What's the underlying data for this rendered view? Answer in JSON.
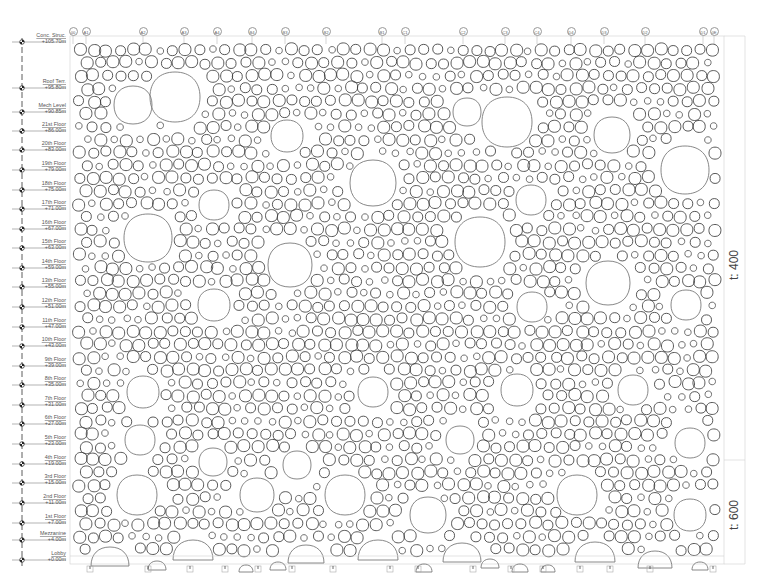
{
  "levels": [
    {
      "name": "Conc. Struc.",
      "elevation": "+105.70m",
      "y": 42
    },
    {
      "name": "Roof Terr.",
      "elevation": "+95.80m",
      "y": 88
    },
    {
      "name": "Mech Level",
      "elevation": "+90.85m",
      "y": 112
    },
    {
      "name": "21st Floor",
      "elevation": "+86.00m",
      "y": 131
    },
    {
      "name": "20th Floor",
      "elevation": "+83.00m",
      "y": 150
    },
    {
      "name": "19th Floor",
      "elevation": "+79.00m",
      "y": 170
    },
    {
      "name": "18th Floor",
      "elevation": "+75.00m",
      "y": 190
    },
    {
      "name": "17th Floor",
      "elevation": "+71.00m",
      "y": 209
    },
    {
      "name": "16th Floor",
      "elevation": "+67.00m",
      "y": 229
    },
    {
      "name": "15th Floor",
      "elevation": "+63.00m",
      "y": 248
    },
    {
      "name": "14th Floor",
      "elevation": "+59.00m",
      "y": 268
    },
    {
      "name": "13th Floor",
      "elevation": "+55.00m",
      "y": 287
    },
    {
      "name": "12th Floor",
      "elevation": "+51.00m",
      "y": 307
    },
    {
      "name": "11th Floor",
      "elevation": "+47.00m",
      "y": 327
    },
    {
      "name": "10th Floor",
      "elevation": "+43.00m",
      "y": 346
    },
    {
      "name": "9th Floor",
      "elevation": "+39.00m",
      "y": 366
    },
    {
      "name": "8th Floor",
      "elevation": "+35.00m",
      "y": 385
    },
    {
      "name": "7th Floor",
      "elevation": "+31.00m",
      "y": 405
    },
    {
      "name": "6th Floor",
      "elevation": "+27.00m",
      "y": 424
    },
    {
      "name": "5th Floor",
      "elevation": "+23.00m",
      "y": 444
    },
    {
      "name": "4th Floor",
      "elevation": "+19.00m",
      "y": 464
    },
    {
      "name": "3rd Floor",
      "elevation": "+15.00m",
      "y": 483
    },
    {
      "name": "2nd Floor",
      "elevation": "+11.00m",
      "y": 503
    },
    {
      "name": "1st Floor",
      "elevation": "+7.00m",
      "y": 523
    },
    {
      "name": "Mezzanine",
      "elevation": "+4.00m",
      "y": 540
    },
    {
      "name": "Lobby",
      "elevation": "+0.00m",
      "y": 560
    }
  ],
  "grid_lines": [
    {
      "label": "00",
      "x": 73
    },
    {
      "label": "A1",
      "x": 86
    },
    {
      "label": "A2",
      "x": 143
    },
    {
      "label": "A3",
      "x": 184
    },
    {
      "label": "A4",
      "x": 217
    },
    {
      "label": "B4",
      "x": 252
    },
    {
      "label": "B3",
      "x": 285
    },
    {
      "label": "B2",
      "x": 326
    },
    {
      "label": "B1",
      "x": 382
    },
    {
      "label": "C1",
      "x": 405
    },
    {
      "label": "C2",
      "x": 463
    },
    {
      "label": "C3",
      "x": 505
    },
    {
      "label": "C4",
      "x": 537
    },
    {
      "label": "D4",
      "x": 571
    },
    {
      "label": "D3",
      "x": 604
    },
    {
      "label": "D2",
      "x": 645
    },
    {
      "label": "D1",
      "x": 703
    },
    {
      "label": "0E",
      "x": 714
    }
  ],
  "annotations": [
    {
      "text": "t: 400",
      "x": 737,
      "y": 265
    },
    {
      "text": "t: 600",
      "x": 737,
      "y": 515
    }
  ],
  "large_openings": [
    [
      133,
      105,
      38
    ],
    [
      175,
      97,
      50
    ],
    [
      287,
      136,
      32
    ],
    [
      467,
      112,
      28
    ],
    [
      507,
      122,
      50
    ],
    [
      612,
      135,
      36
    ],
    [
      373,
      183,
      46
    ],
    [
      214,
      205,
      30
    ],
    [
      531,
      200,
      30
    ],
    [
      685,
      170,
      48
    ],
    [
      148,
      238,
      48
    ],
    [
      480,
      242,
      50
    ],
    [
      290,
      265,
      44
    ],
    [
      608,
      283,
      44
    ],
    [
      214,
      305,
      32
    ],
    [
      532,
      307,
      30
    ],
    [
      686,
      305,
      30
    ],
    [
      143,
      392,
      32
    ],
    [
      373,
      392,
      30
    ],
    [
      517,
      390,
      32
    ],
    [
      633,
      390,
      30
    ],
    [
      140,
      440,
      30
    ],
    [
      460,
      440,
      28
    ],
    [
      690,
      443,
      30
    ],
    [
      297,
      465,
      28
    ],
    [
      213,
      462,
      28
    ],
    [
      137,
      495,
      40
    ],
    [
      257,
      495,
      34
    ],
    [
      345,
      495,
      40
    ],
    [
      428,
      515,
      36
    ],
    [
      577,
      495,
      40
    ],
    [
      690,
      515,
      32
    ]
  ],
  "base_arches": [
    [
      110,
      566,
      38
    ],
    [
      193,
      560,
      40
    ],
    [
      306,
      563,
      36
    ],
    [
      378,
      560,
      40
    ],
    [
      462,
      562,
      38
    ],
    [
      595,
      562,
      40
    ],
    [
      655,
      568,
      34
    ],
    [
      157,
      570,
      18
    ],
    [
      246,
      572,
      14
    ],
    [
      278,
      570,
      16
    ],
    [
      424,
      572,
      16
    ],
    [
      490,
      568,
      18
    ],
    [
      520,
      572,
      16
    ],
    [
      548,
      572,
      14
    ],
    [
      700,
      570,
      16
    ]
  ],
  "footings_x": [
    90,
    148,
    190,
    225,
    258,
    292,
    333,
    390,
    418,
    473,
    511,
    543,
    580,
    610,
    650,
    713
  ],
  "colors": {
    "stroke": "#3a3a3a",
    "stroke_light": "#7a7a7a",
    "guide": "#d0d0d0",
    "text": "#555555"
  }
}
